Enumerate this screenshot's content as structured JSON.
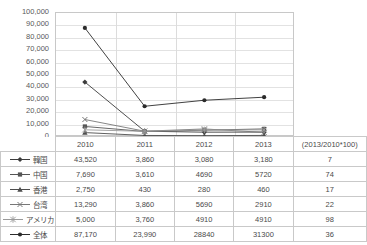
{
  "chart_data": {
    "type": "line",
    "title": "",
    "xlabel": "",
    "ylabel": "",
    "categories": [
      "2010",
      "2011",
      "2012",
      "2013"
    ],
    "ylim": [
      0,
      100000
    ],
    "ytick_step": 10000,
    "yticks": [
      "0",
      "10,000",
      "20,000",
      "30,000",
      "40,000",
      "50,000",
      "60,000",
      "70,000",
      "80,000",
      "90,000",
      "100,000"
    ],
    "grid": true,
    "legend_position": "table-left",
    "series": [
      {
        "name": "韓国",
        "marker": "diamond",
        "color": "#3b3b3b",
        "values": [
          43520,
          3860,
          3080,
          3180
        ],
        "labels": [
          "43,520",
          "3,860",
          "3,080",
          "3,180"
        ],
        "ratio": "7"
      },
      {
        "name": "中国",
        "marker": "square",
        "color": "#555555",
        "values": [
          7690,
          3610,
          4690,
          5720
        ],
        "labels": [
          "7,690",
          "3,610",
          "4690",
          "5720"
        ],
        "ratio": "74"
      },
      {
        "name": "香港",
        "marker": "triangle",
        "color": "#4d4d4d",
        "values": [
          2750,
          430,
          280,
          460
        ],
        "labels": [
          "2,750",
          "430",
          "280",
          "460"
        ],
        "ratio": "17"
      },
      {
        "name": "台湾",
        "marker": "cross",
        "color": "#777777",
        "values": [
          13290,
          3860,
          5690,
          2910
        ],
        "labels": [
          "13,290",
          "3,860",
          "5690",
          "2910"
        ],
        "ratio": "22"
      },
      {
        "name": "アメリカ",
        "marker": "asterisk",
        "color": "#9a9a9a",
        "values": [
          5000,
          3760,
          4910,
          4910
        ],
        "labels": [
          "5,000",
          "3,760",
          "4910",
          "4910"
        ],
        "ratio": "98"
      },
      {
        "name": "全体",
        "marker": "circle",
        "color": "#2b2b2b",
        "values": [
          87170,
          23990,
          28840,
          31300
        ],
        "labels": [
          "87,170",
          "23,990",
          "28840",
          "31300"
        ],
        "ratio": "36"
      }
    ],
    "ratio_header": "(2013/2010*100)"
  },
  "table": {
    "corner_label": "",
    "year_headers": [
      "2010",
      "2011",
      "2012",
      "2013"
    ],
    "ratio_header": "(2013/2010*100)",
    "rows": [
      {
        "label": "韓国",
        "marker": "diamond",
        "cells": [
          "43,520",
          "3,860",
          "3,080",
          "3,180"
        ],
        "ratio": "7"
      },
      {
        "label": "中国",
        "marker": "square",
        "cells": [
          "7,690",
          "3,610",
          "4690",
          "5720"
        ],
        "ratio": "74"
      },
      {
        "label": "香港",
        "marker": "triangle",
        "cells": [
          "2,750",
          "430",
          "280",
          "460"
        ],
        "ratio": "17"
      },
      {
        "label": "台湾",
        "marker": "cross",
        "cells": [
          "13,290",
          "3,860",
          "5690",
          "2910"
        ],
        "ratio": "22"
      },
      {
        "label": "アメリカ",
        "marker": "asterisk",
        "cells": [
          "5,000",
          "3,760",
          "4910",
          "4910"
        ],
        "ratio": "98"
      },
      {
        "label": "全体",
        "marker": "circle",
        "cells": [
          "87,170",
          "23,990",
          "28840",
          "31300"
        ],
        "ratio": "36"
      }
    ]
  },
  "colors": {
    "grid": "#e2e2e2",
    "frame": "#c8c8c8",
    "text": "#4a4a4a",
    "table_border": "#c9c9c9"
  }
}
